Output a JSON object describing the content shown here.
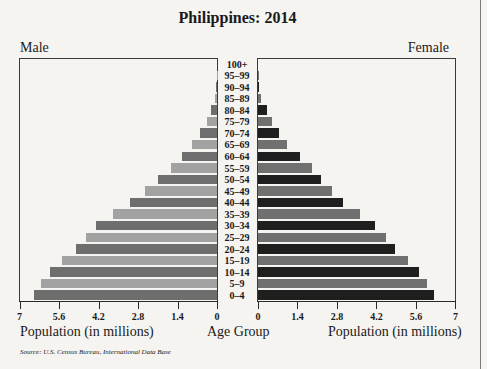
{
  "chart_data": {
    "type": "bar",
    "subtype": "population_pyramid",
    "title": "Philippines: 2014",
    "left_label": "Male",
    "right_label": "Female",
    "center_axis_label": "Age Group",
    "xlabel_left": "Population (in millions)",
    "xlabel_right": "Population (in millions)",
    "source": "Source: U.S. Census Bureau, International Data Base",
    "categories": [
      "100+",
      "95–99",
      "90–94",
      "85–89",
      "80–84",
      "75–79",
      "70–74",
      "65–69",
      "60–64",
      "55–59",
      "50–54",
      "45–49",
      "40–44",
      "35–39",
      "30–34",
      "25–29",
      "20–24",
      "15–19",
      "10–14",
      "5–9",
      "0–4"
    ],
    "series": [
      {
        "name": "Male",
        "values": [
          0.0,
          0.01,
          0.02,
          0.08,
          0.21,
          0.36,
          0.61,
          0.89,
          1.25,
          1.64,
          2.1,
          2.54,
          3.07,
          3.68,
          4.29,
          4.64,
          5.0,
          5.5,
          5.93,
          6.25,
          6.5
        ]
      },
      {
        "name": "Female",
        "values": [
          0.0,
          0.02,
          0.04,
          0.11,
          0.32,
          0.5,
          0.75,
          1.04,
          1.5,
          1.93,
          2.25,
          2.61,
          3.0,
          3.61,
          4.14,
          4.54,
          4.86,
          5.32,
          5.71,
          6.0,
          6.25
        ]
      }
    ],
    "xlim": [
      0,
      7
    ],
    "xticks_left": [
      "7",
      "5.6",
      "4.2",
      "2.8",
      "1.4",
      "0"
    ],
    "xticks_right": [
      "0",
      "1.4",
      "2.8",
      "4.2",
      "5.6",
      "7"
    ],
    "tick_values": [
      0,
      1.4,
      2.8,
      4.2,
      5.6,
      7
    ],
    "grid": false,
    "colors": {
      "male_dark": "#6e6e6e",
      "male_light": "#a2a2a2",
      "female_dark": "#1f1f1f",
      "female_light": "#707070"
    }
  }
}
